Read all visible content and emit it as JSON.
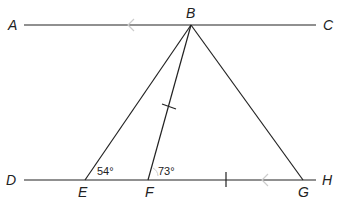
{
  "diagram": {
    "type": "geometry",
    "points": {
      "A": {
        "label": "A"
      },
      "B": {
        "label": "B"
      },
      "C": {
        "label": "C"
      },
      "D": {
        "label": "D"
      },
      "E": {
        "label": "E"
      },
      "F": {
        "label": "F"
      },
      "G": {
        "label": "G"
      },
      "H": {
        "label": "H"
      }
    },
    "angles": {
      "angle_E": "54°",
      "angle_F": "73°"
    },
    "marks": {
      "parallel_arrows": [
        "AC",
        "DH"
      ],
      "equal_ticks": [
        "BF",
        "FG"
      ]
    },
    "colors": {
      "line": "#222222",
      "arrow": "#cccccc"
    }
  }
}
